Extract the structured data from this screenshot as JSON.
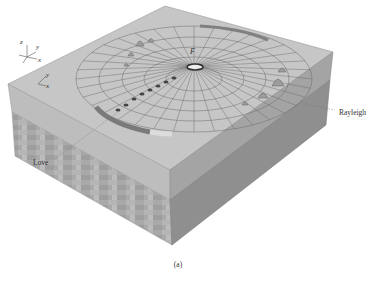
{
  "figure": {
    "caption": "(a)",
    "source_label": "F",
    "wave_labels": {
      "love": "Love",
      "rayleigh": "Rayleigh"
    },
    "axes_3d": {
      "z": "z",
      "y": "y",
      "x": "x"
    },
    "axes_2d": {
      "y": "y",
      "x": "x"
    },
    "bottom_fragment": "..."
  },
  "colors": {
    "top_surface": "#c4c4c4",
    "front_face": "#bdbdbd",
    "side_face": "#9a9a9a",
    "lower_layer": "#a8a8a8",
    "grid_line": "#6a6a6a",
    "band_dark": "#777777",
    "band_light": "#dcdcdc"
  }
}
